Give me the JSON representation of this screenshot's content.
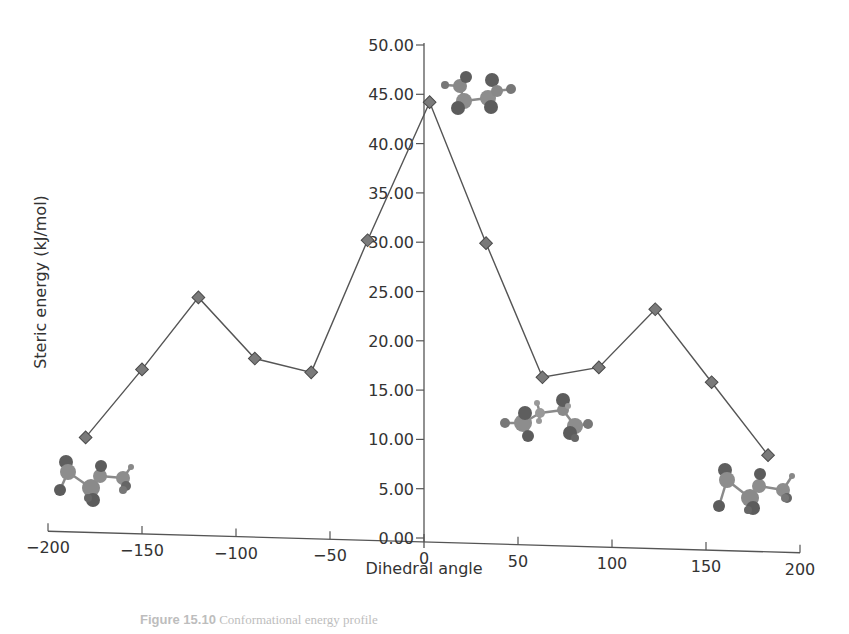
{
  "chart_data": {
    "type": "line",
    "title": "",
    "xlabel": "Dihedral angle",
    "ylabel": "Steric energy (kJ/mol)",
    "xlim": [
      -200,
      200
    ],
    "ylim": [
      0,
      50
    ],
    "x_ticks": [
      "-200",
      "-150",
      "-100",
      "-50",
      "0",
      "50",
      "100",
      "150",
      "200"
    ],
    "y_ticks": [
      "0.00",
      "5.00",
      "10.00",
      "15.00",
      "20.00",
      "25.00",
      "30.00",
      "35.00",
      "40.00",
      "45.00",
      "50.00"
    ],
    "grid": false,
    "legend": null,
    "marker": "diamond",
    "series": [
      {
        "name": "Steric energy",
        "x": [
          -180,
          -150,
          -120,
          -90,
          -60,
          -30,
          3,
          33,
          63,
          93,
          123,
          153,
          183
        ],
        "y": [
          10.2,
          17.1,
          24.4,
          18.2,
          16.8,
          30.2,
          44.2,
          29.9,
          16.3,
          17.3,
          23.2,
          15.8,
          8.4
        ]
      }
    ],
    "annotations": [
      {
        "type": "molecule-model",
        "label": "eclipsed conformer (top)",
        "near_x": 3,
        "near_y": 44
      },
      {
        "type": "molecule-model",
        "label": "gauche conformer",
        "near_x": 63,
        "near_y": 12
      },
      {
        "type": "molecule-model",
        "label": "anti conformer (left)",
        "near_x": -180,
        "near_y": 6
      },
      {
        "type": "molecule-model",
        "label": "anti conformer (right)",
        "near_x": 180,
        "near_y": 4
      }
    ]
  },
  "caption": {
    "label": "Figure 15.10",
    "text": "Conformational energy profile"
  }
}
